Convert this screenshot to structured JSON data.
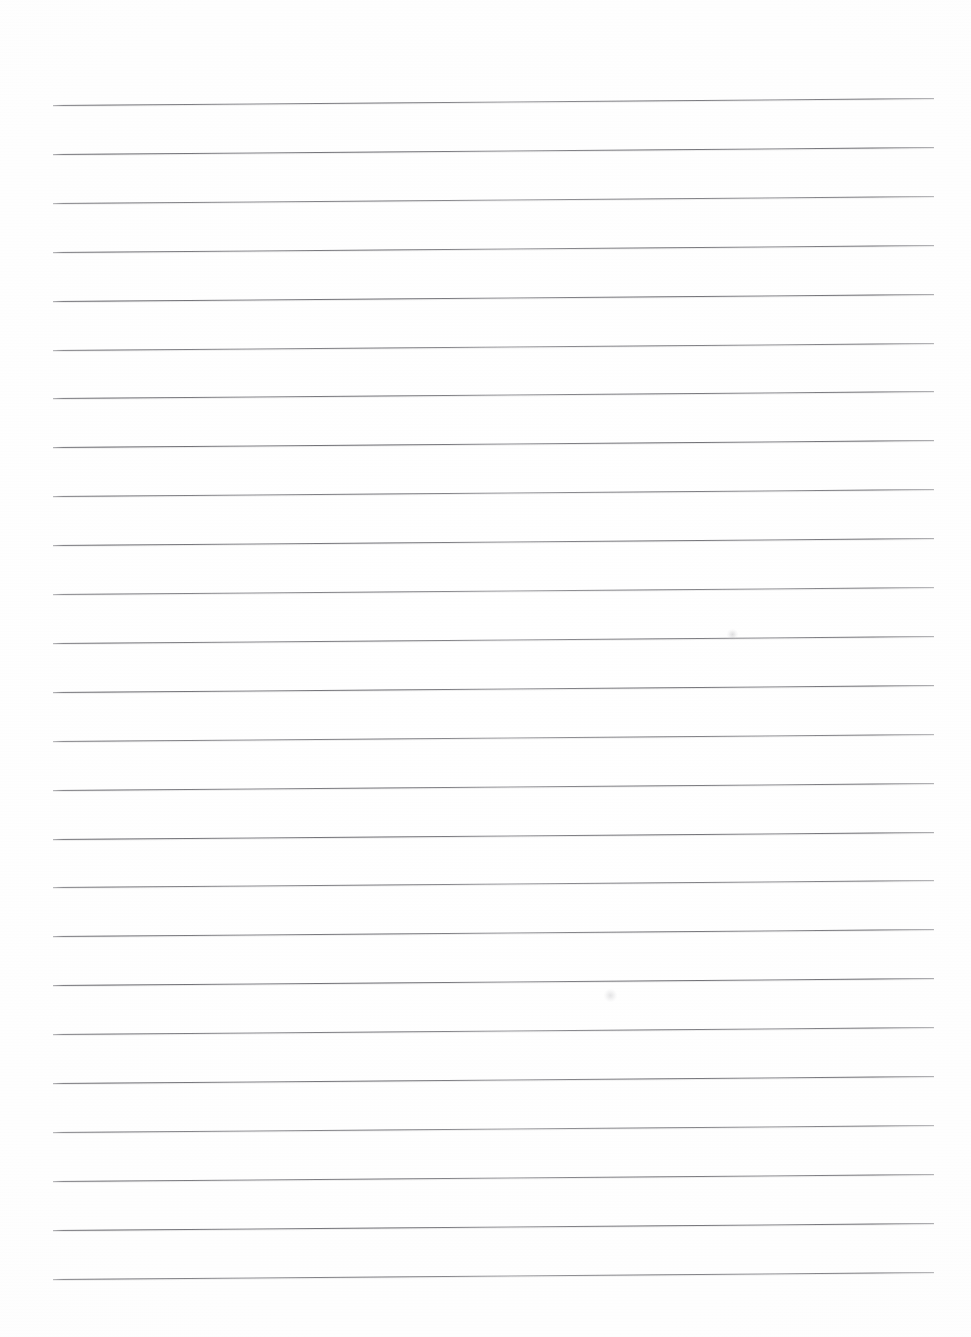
{
  "document": {
    "kind": "scanned-lined-paper",
    "title": "Blank Lined Notebook Page",
    "description": "Scan of an empty sheet of wide-ruled writing paper; no handwriting, no printed text.",
    "page_width": 971,
    "page_height": 1337,
    "background_color": "#fefefe",
    "paper_color": "#ffffff",
    "has_text_content": false,
    "has_margin_rule": false,
    "has_holes": false,
    "orientation": "portrait"
  },
  "ruling": {
    "line_color": "#5e5e64",
    "line_thickness_px": 1.35,
    "line_count": 25,
    "line_left_x": 53,
    "line_right_x": 934,
    "line_length_px": 881,
    "first_line_y": 105,
    "last_line_y": 1279,
    "line_spacing_px": 48.9,
    "skew_degrees": -0.45,
    "skew_note": "Lines rise slightly from left to right due to scan skew (~7px over full width).",
    "lines": [
      {
        "index": 1,
        "y": 105.0
      },
      {
        "index": 2,
        "y": 153.9
      },
      {
        "index": 3,
        "y": 202.8
      },
      {
        "index": 4,
        "y": 251.7
      },
      {
        "index": 5,
        "y": 300.6
      },
      {
        "index": 6,
        "y": 349.5
      },
      {
        "index": 7,
        "y": 398.4
      },
      {
        "index": 8,
        "y": 447.3
      },
      {
        "index": 9,
        "y": 496.2
      },
      {
        "index": 10,
        "y": 545.1
      },
      {
        "index": 11,
        "y": 594.0
      },
      {
        "index": 12,
        "y": 642.9
      },
      {
        "index": 13,
        "y": 691.8
      },
      {
        "index": 14,
        "y": 740.7
      },
      {
        "index": 15,
        "y": 789.6
      },
      {
        "index": 16,
        "y": 838.5
      },
      {
        "index": 17,
        "y": 887.4
      },
      {
        "index": 18,
        "y": 936.3
      },
      {
        "index": 19,
        "y": 985.2
      },
      {
        "index": 20,
        "y": 1034.1
      },
      {
        "index": 21,
        "y": 1083.0
      },
      {
        "index": 22,
        "y": 1131.9
      },
      {
        "index": 23,
        "y": 1180.8
      },
      {
        "index": 24,
        "y": 1229.7
      },
      {
        "index": 25,
        "y": 1278.6
      }
    ]
  },
  "artifacts": {
    "smudges": [
      {
        "name": "scan-smudge-upper",
        "x": 732,
        "y": 634,
        "size": 11
      },
      {
        "name": "scan-smudge-lower",
        "x": 610,
        "y": 995,
        "size": 13
      }
    ]
  },
  "margins": {
    "top_blank_px": 105,
    "bottom_blank_px": 58,
    "left_blank_px": 53,
    "right_blank_px": 37
  }
}
